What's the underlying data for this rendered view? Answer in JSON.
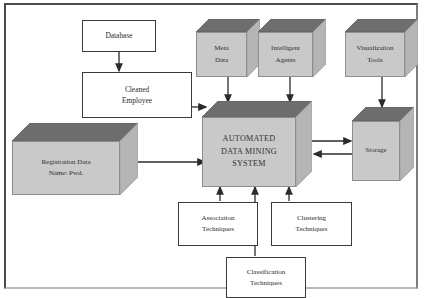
{
  "diagram": {
    "colors": {
      "frame_border": "#4a4a4a",
      "box_border": "#3a3a3a",
      "cube_front": "#c9c9c9",
      "cube_top": "#6e6e6e",
      "cube_side": "#b5b5b5",
      "arrow": "#2b2b2b",
      "text": "#2c2c2c",
      "background": "#ffffff"
    },
    "nodes": {
      "database": {
        "label": "Database",
        "shape": "rectangle"
      },
      "cleaned_employee": {
        "line1": "Cleaned",
        "line2": "Employee",
        "shape": "rectangle"
      },
      "registration_data": {
        "line1": "Registration Data",
        "line2": "Name: Pwd.",
        "shape": "cube"
      },
      "meta_data": {
        "line1": "Meta",
        "line2": "Data",
        "shape": "cube"
      },
      "intelligent_agents": {
        "line1": "Intelligent",
        "line2": "Agents",
        "shape": "cube"
      },
      "visualization_tools": {
        "line1": "Visualization",
        "line2": "Tools",
        "shape": "cube"
      },
      "system": {
        "line1": "AUTOMATED",
        "line2": "DATA MINING",
        "line3": "SYSTEM",
        "shape": "cube"
      },
      "storage": {
        "label": "Storage",
        "shape": "cube"
      },
      "association": {
        "line1": "Association",
        "line2": "Techniques",
        "shape": "rectangle"
      },
      "clustering": {
        "line1": "Clustering",
        "line2": "Techniques",
        "shape": "rectangle"
      },
      "classification": {
        "line1": "Classification",
        "line2": "Techniques",
        "shape": "rectangle"
      }
    },
    "edges": [
      {
        "from": "database",
        "to": "cleaned_employee",
        "direction": "down"
      },
      {
        "from": "cleaned_employee",
        "to": "system",
        "direction": "right"
      },
      {
        "from": "registration_data",
        "to": "system",
        "direction": "right"
      },
      {
        "from": "meta_data",
        "to": "system",
        "direction": "down"
      },
      {
        "from": "intelligent_agents",
        "to": "system",
        "direction": "down"
      },
      {
        "from": "visualization_tools",
        "to": "storage",
        "direction": "down"
      },
      {
        "from": "system",
        "to": "storage",
        "direction": "right"
      },
      {
        "from": "storage",
        "to": "system",
        "direction": "left"
      },
      {
        "from": "association",
        "to": "system",
        "direction": "up"
      },
      {
        "from": "classification",
        "to": "system",
        "direction": "up"
      },
      {
        "from": "clustering",
        "to": "system",
        "direction": "up"
      }
    ]
  }
}
